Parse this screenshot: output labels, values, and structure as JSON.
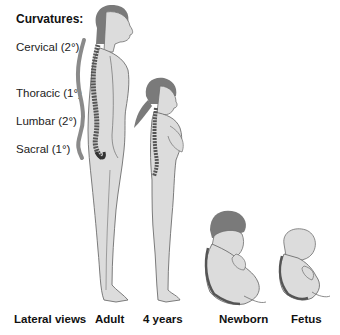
{
  "title": "Curvatures:",
  "curvatures": [
    {
      "label": "Cervical (2°)",
      "top": 41
    },
    {
      "label": "Thoracic (1°)",
      "top": 87
    },
    {
      "label": "Lumbar (2°)",
      "top": 115
    },
    {
      "label": "Sacral (1°)",
      "top": 143
    }
  ],
  "stages": [
    {
      "label": "Lateral views",
      "left": 14
    },
    {
      "label": "Adult",
      "left": 95
    },
    {
      "label": "4 years",
      "left": 143
    },
    {
      "label": "Newborn",
      "left": 219
    },
    {
      "label": "Fetus",
      "left": 291
    }
  ],
  "colors": {
    "body_fill": "#dcdcdc",
    "outline": "#6e6e6e",
    "hair": "#7a7a7a",
    "spine": "#555555",
    "curve_line": "#8a8a8a",
    "text": "#111111"
  }
}
